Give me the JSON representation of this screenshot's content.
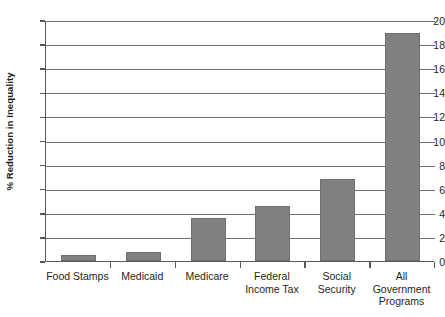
{
  "chart_data": {
    "type": "bar",
    "title": "",
    "xlabel": "",
    "ylabel": "% Reduction in Inequality",
    "ylim": [
      0,
      20
    ],
    "ytick_step": 2,
    "yticks": [
      "20",
      "18",
      "16",
      "14",
      "12",
      "10",
      "8",
      "6",
      "4",
      "2",
      "0"
    ],
    "grid": true,
    "grid_axis": "y",
    "legend": "none",
    "categories": [
      "Food Stamps",
      "Medicaid",
      "Medicare",
      "Federal Income Tax",
      "Social Security",
      "All Government Programs"
    ],
    "category_lines": [
      [
        "Food Stamps"
      ],
      [
        "Medicaid"
      ],
      [
        "Medicare"
      ],
      [
        "Federal",
        "Income Tax"
      ],
      [
        "Social",
        "Security"
      ],
      [
        "All",
        "Government",
        "Programs"
      ]
    ],
    "values": [
      0.5,
      0.75,
      3.6,
      4.6,
      6.8,
      18.9
    ],
    "bar_color": "#808080",
    "axis_color": "#58595b",
    "grid_color": "#6d6e71",
    "background_color": "#ffffff"
  }
}
